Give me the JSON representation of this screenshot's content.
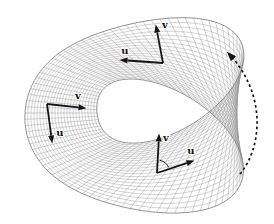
{
  "figure": {
    "kind": "mobius-strip-wireframe",
    "background_color": "#ffffff",
    "mesh_color": "#9a9a9a",
    "mesh_edge_color": "#7e7e7e",
    "ink_color": "#141414",
    "frames": [
      {
        "id": "top",
        "origin": [
          163,
          63
        ],
        "u": {
          "label": "u",
          "tip": [
            121,
            60
          ],
          "label_pos": [
            125,
            50
          ]
        },
        "v": {
          "label": "v",
          "tip": [
            156,
            26
          ],
          "label_pos": [
            165,
            24
          ]
        }
      },
      {
        "id": "left",
        "origin": [
          47,
          104
        ],
        "u": {
          "label": "u",
          "tip": [
            52,
            142
          ],
          "label_pos": [
            60,
            132
          ]
        },
        "v": {
          "label": "v",
          "tip": [
            85,
            108
          ],
          "label_pos": [
            78,
            95
          ]
        }
      },
      {
        "id": "bottom",
        "origin": [
          157,
          173
        ],
        "u": {
          "label": "u",
          "tip": [
            193,
            161
          ],
          "label_pos": [
            191,
            150
          ]
        },
        "v": {
          "label": "v",
          "tip": [
            159,
            135
          ],
          "label_pos": [
            166,
            137
          ]
        },
        "angle_arc": {
          "radius": 13,
          "start_deg": -78,
          "end_deg": -26
        }
      }
    ],
    "rotation_arrow": {
      "start": [
        240,
        174
      ],
      "c1": [
        262,
        148
      ],
      "c2": [
        267,
        94
      ],
      "end": [
        229,
        54
      ],
      "dash": "2.6 2.8"
    }
  }
}
